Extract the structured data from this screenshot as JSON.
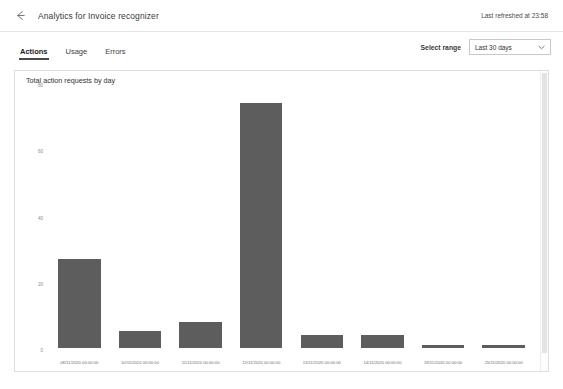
{
  "header": {
    "back_icon": "back-arrow-icon",
    "title": "Analytics for Invoice recognizer",
    "refresh_status": "Last refreshed at 23:58"
  },
  "tabs": [
    {
      "label": "Actions",
      "active": true
    },
    {
      "label": "Usage",
      "active": false
    },
    {
      "label": "Errors",
      "active": false
    }
  ],
  "range": {
    "label": "Select range",
    "value": "Last 30 days",
    "chevron_icon": "chevron-down-icon",
    "options": [
      "Last 30 days"
    ]
  },
  "colors": {
    "bar": "#5d5d5d",
    "panel_border": "#dedede",
    "tab_underline": "#4a4a4a",
    "axis_text": "#8a8a8a"
  },
  "chart_data": {
    "type": "bar",
    "title": "Total action requests by day",
    "xlabel": "",
    "ylabel": "",
    "ylim": [
      0,
      80
    ],
    "yticks": [
      0,
      20,
      40,
      60,
      80
    ],
    "ytick_labels": [
      "0",
      "20",
      "40",
      "60",
      "80"
    ],
    "grid": false,
    "legend": "none",
    "categories": [
      "08/11/2020 00:00:00",
      "10/11/2020 00:00:00",
      "11/11/2020 00:00:00",
      "12/11/2020 00:00:00",
      "13/11/2020 00:00:00",
      "14/11/2020 00:00:00",
      "19/11/2020 00:00:00",
      "25/11/2020 00:00:00"
    ],
    "values": [
      27,
      5,
      8,
      74,
      4,
      4,
      1,
      1
    ]
  }
}
